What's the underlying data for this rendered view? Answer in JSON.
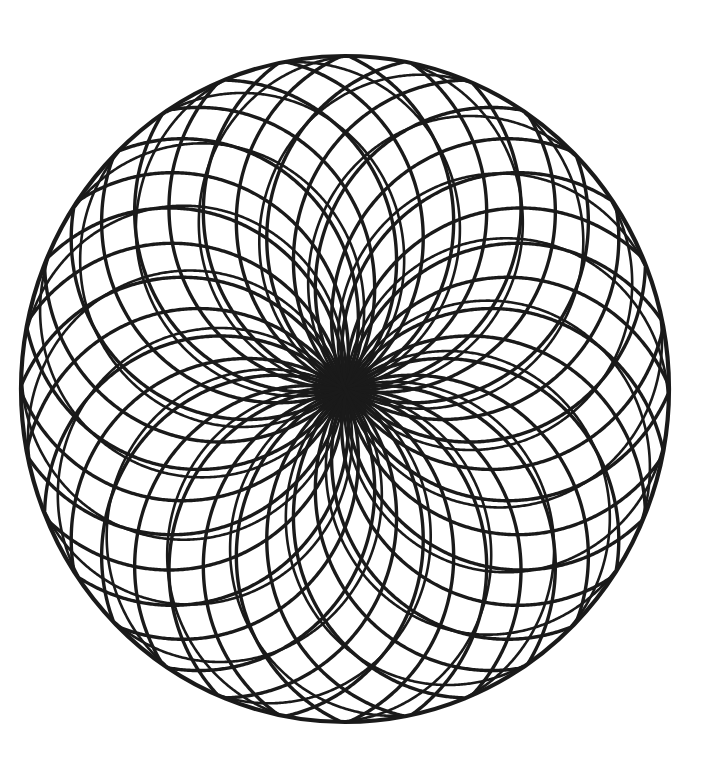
{
  "page": {
    "background_color": "#ffffff",
    "width": 722,
    "height": 768
  },
  "artwork": {
    "name": "Rose Window Mandala",
    "description": "Black line-art mandala: a large outer circle filled with overlapping equal-radius circular arcs that all pass through the common center, creating a radiating petal rosette.",
    "ink_color": "#1a1a1a",
    "fill_color": "none"
  },
  "chart_data": {
    "type": "line",
    "xlabel": "",
    "ylabel": "",
    "grid": false,
    "legend": "none",
    "xlim": [
      0,
      722
    ],
    "ylim": [
      0,
      768
    ],
    "geometry": {
      "center": {
        "x": 345,
        "y": 389
      },
      "outer_circle": {
        "name": "outer-boundary-circle",
        "cx": 345,
        "cy": 389,
        "rx": 324,
        "ry": 333,
        "stroke_width": 4.2
      },
      "petal_family_a": {
        "name": "primary-petal-arcs",
        "count": 16,
        "arc_radius_x": 176,
        "arc_radius_y": 181,
        "ring_radius_x": 176,
        "ring_radius_y": 181,
        "angle_offset_deg": 0,
        "stroke_width": 3.4
      },
      "petal_family_b": {
        "name": "secondary-petal-arcs",
        "count": 16,
        "arc_radius_x": 176,
        "arc_radius_y": 181,
        "ring_radius_x": 176,
        "ring_radius_y": 181,
        "angle_offset_deg": 11.25,
        "stroke_width": 3.4
      },
      "petal_family_c": {
        "name": "inner-sliver-arcs",
        "count": 16,
        "arc_radius_x": 162,
        "arc_radius_y": 167,
        "ring_radius_x": 162,
        "ring_radius_y": 167,
        "angle_offset_deg": 5.6,
        "stroke_width": 2.6
      }
    }
  }
}
